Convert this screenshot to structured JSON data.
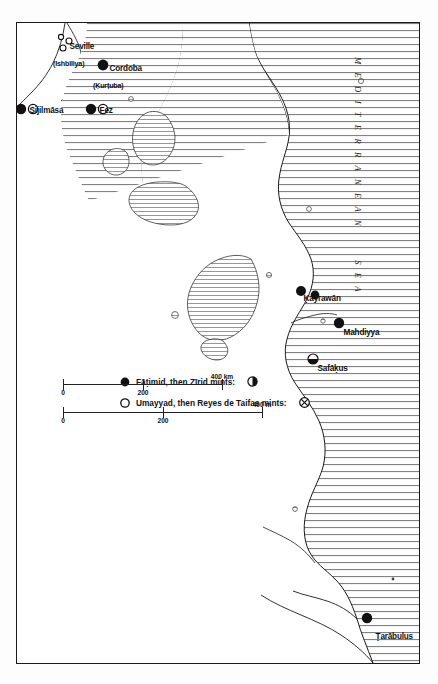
{
  "figure": {
    "type": "historical-map",
    "orientation": "rotated-90-clockwise",
    "sea_label": "M E D I T E R R A N E A N      S E A"
  },
  "legend": {
    "entries": [
      {
        "label": "Fāṭimid, then Zīrid mints:",
        "symbol": "filled-circle",
        "symbol_name": "filled-circle-icon"
      },
      {
        "label": "Umayyad, then Reyes de Taifas mints:",
        "symbol": "hollow-circle",
        "symbol_name": "hollow-circle-icon"
      },
      {
        "label": "",
        "symbol": "half-filled-circle",
        "symbol_name": "half-filled-circle-icon"
      },
      {
        "label": "",
        "symbol": "crossed-circle",
        "symbol_name": "crossed-circle-icon"
      }
    ]
  },
  "scales": [
    {
      "unit": "400 km",
      "ticks": [
        "0",
        "200",
        "400"
      ],
      "tick_values": [
        0,
        200,
        400
      ]
    },
    {
      "unit": "400 m",
      "ticks": [
        "0",
        "200",
        "400"
      ],
      "tick_values": [
        0,
        200,
        400
      ]
    }
  ],
  "cities": [
    {
      "name": "Ṭarābulus",
      "sub": "",
      "marker": "filled-circle",
      "x": 400,
      "y": 28
    },
    {
      "name": "Mahdiyya",
      "sub": "",
      "marker": "filled-circle",
      "x": 243,
      "y": 78
    },
    {
      "name": "Ḳayrawān",
      "sub": "",
      "marker": "filled-pair",
      "x": 222,
      "y": 103
    },
    {
      "name": "Safāḳus",
      "sub": "",
      "marker": "half-filled",
      "x": 281,
      "y": 110
    },
    {
      "name": "Fez",
      "sub": "",
      "marker": "stacked-pair",
      "x": 60,
      "y": 300
    },
    {
      "name": "Sijilmāsa",
      "sub": "",
      "marker": "stacked-pair",
      "x": 60,
      "y": 372
    },
    {
      "name": "Cordoba",
      "sub": "(Ḳurṭuba)",
      "marker": "filled-circle",
      "x": 610,
      "y": 318
    },
    {
      "name": "Seville",
      "sub": "(Ishbīliya)",
      "marker": "small-cluster",
      "x": 644,
      "y": 296
    }
  ],
  "colors": {
    "ink": "#1a1a1a",
    "sea_hatch": "#555555",
    "paper": "#ffffff",
    "page": "#fdfdfd"
  }
}
